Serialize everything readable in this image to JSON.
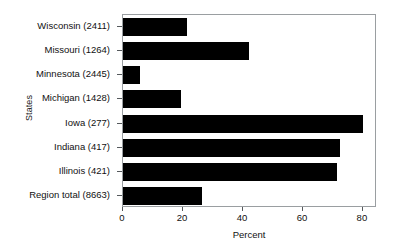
{
  "chart_data": {
    "type": "bar",
    "orientation": "horizontal",
    "title": "",
    "xlabel": "Percent",
    "ylabel": "States",
    "categories": [
      "Wisconsin (2411)",
      "Missouri (1264)",
      "Minnesota (2445)",
      "Michigan (1428)",
      "Iowa (277)",
      "Indiana (417)",
      "Illinois (421)",
      "Region total (8663)"
    ],
    "values": [
      21.5,
      42.0,
      5.7,
      19.3,
      80.0,
      72.3,
      71.3,
      26.3
    ],
    "xticks": [
      0,
      20,
      40,
      60,
      80
    ],
    "xticklabels": [
      "0",
      "20",
      "40",
      "60",
      "80"
    ],
    "xlim": [
      0,
      84.7
    ],
    "grid": false,
    "legend": null,
    "bar_color": "#000000",
    "frame_color": "#9a9ea1"
  }
}
